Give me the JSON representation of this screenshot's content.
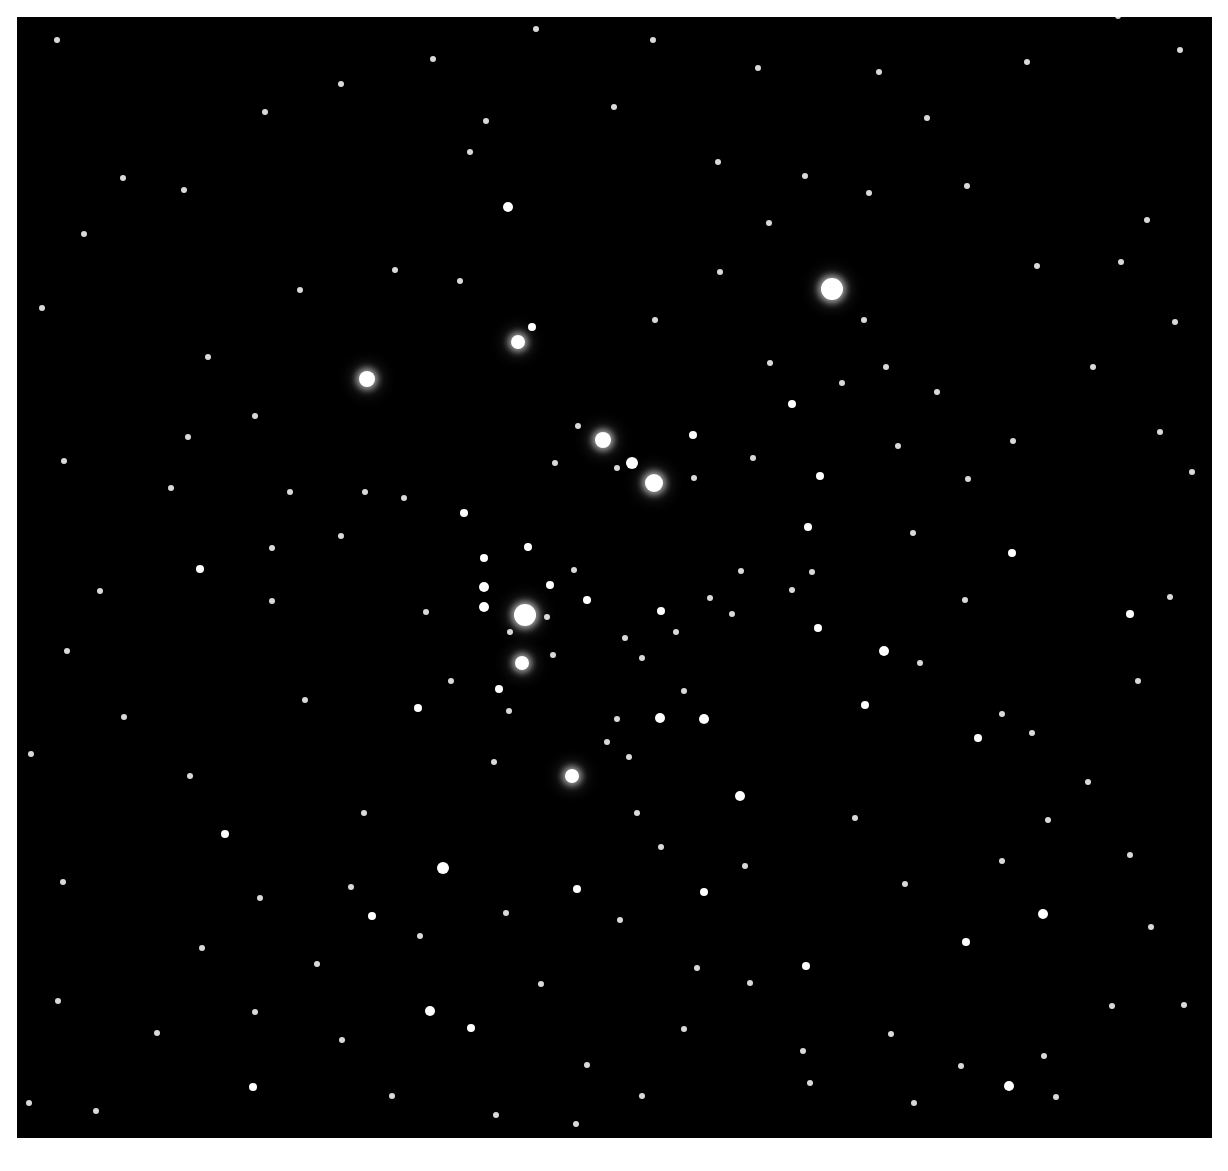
{
  "image": {
    "subject": "open star cluster photograph",
    "frame": {
      "left": 17,
      "top": 17,
      "width": 1195,
      "height": 1121,
      "background": "#000000",
      "border_color": "#ffffff"
    }
  },
  "stars": [
    [
      832,
      289,
      11,
      1
    ],
    [
      525,
      615,
      11,
      1
    ],
    [
      654,
      483,
      9,
      1
    ],
    [
      603,
      440,
      8,
      1
    ],
    [
      367,
      379,
      8,
      1
    ],
    [
      518,
      342,
      7,
      1
    ],
    [
      522,
      663,
      7,
      1
    ],
    [
      572,
      776,
      7,
      1
    ],
    [
      632,
      463,
      6,
      0
    ],
    [
      508,
      207,
      5,
      0
    ],
    [
      484,
      607,
      5,
      0
    ],
    [
      484,
      587,
      5,
      0
    ],
    [
      443,
      868,
      6,
      0
    ],
    [
      740,
      796,
      5,
      0
    ],
    [
      660,
      718,
      5,
      0
    ],
    [
      704,
      719,
      5,
      0
    ],
    [
      884,
      651,
      5,
      0
    ],
    [
      1043,
      914,
      5,
      0
    ],
    [
      1009,
      1086,
      5,
      0
    ],
    [
      430,
      1011,
      5,
      0
    ],
    [
      532,
      327,
      4,
      0
    ],
    [
      528,
      547,
      4,
      0
    ],
    [
      550,
      585,
      4,
      0
    ],
    [
      587,
      600,
      4,
      0
    ],
    [
      499,
      689,
      4,
      0
    ],
    [
      484,
      558,
      4,
      0
    ],
    [
      464,
      513,
      4,
      0
    ],
    [
      693,
      435,
      4,
      0
    ],
    [
      808,
      527,
      4,
      0
    ],
    [
      818,
      628,
      4,
      0
    ],
    [
      820,
      476,
      4,
      0
    ],
    [
      792,
      404,
      4,
      0
    ],
    [
      661,
      611,
      4,
      0
    ],
    [
      372,
      916,
      4,
      0
    ],
    [
      471,
      1028,
      4,
      0
    ],
    [
      577,
      889,
      4,
      0
    ],
    [
      1130,
      614,
      4,
      0
    ],
    [
      1012,
      553,
      4,
      0
    ],
    [
      200,
      569,
      4,
      0
    ],
    [
      225,
      834,
      4,
      0
    ],
    [
      418,
      708,
      4,
      0
    ],
    [
      978,
      738,
      4,
      0
    ],
    [
      865,
      705,
      4,
      0
    ],
    [
      966,
      942,
      4,
      0
    ],
    [
      806,
      966,
      4,
      0
    ],
    [
      704,
      892,
      4,
      0
    ],
    [
      253,
      1087,
      4,
      0
    ],
    [
      1147,
      220,
      3,
      0
    ],
    [
      1192,
      472,
      3,
      0
    ],
    [
      1027,
      62,
      3,
      0
    ],
    [
      1180,
      50,
      3,
      0
    ],
    [
      1118,
      16,
      3,
      0
    ],
    [
      57,
      40,
      3,
      0
    ],
    [
      123,
      178,
      3,
      0
    ],
    [
      208,
      357,
      3,
      0
    ],
    [
      272,
      548,
      3,
      0
    ],
    [
      272,
      601,
      3,
      0
    ],
    [
      305,
      700,
      3,
      0
    ],
    [
      1032,
      733,
      3,
      0
    ],
    [
      637,
      813,
      3,
      0
    ],
    [
      753,
      458,
      3,
      0
    ],
    [
      769,
      223,
      3,
      0
    ],
    [
      869,
      193,
      3,
      0
    ],
    [
      805,
      176,
      3,
      0
    ],
    [
      1112,
      1006,
      3,
      0
    ],
    [
      1044,
      1056,
      3,
      0
    ],
    [
      914,
      1103,
      3,
      0
    ],
    [
      642,
      1096,
      3,
      0
    ],
    [
      750,
      983,
      3,
      0
    ],
    [
      803,
      1051,
      3,
      0
    ],
    [
      697,
      968,
      3,
      0
    ],
    [
      188,
      437,
      3,
      0
    ],
    [
      460,
      281,
      3,
      0
    ],
    [
      486,
      121,
      3,
      0
    ],
    [
      578,
      426,
      3,
      0
    ],
    [
      555,
      463,
      3,
      0
    ],
    [
      617,
      468,
      3,
      0
    ],
    [
      694,
      478,
      3,
      0
    ],
    [
      741,
      571,
      3,
      0
    ],
    [
      792,
      590,
      3,
      0
    ],
    [
      812,
      572,
      3,
      0
    ],
    [
      913,
      533,
      3,
      0
    ],
    [
      920,
      663,
      3,
      0
    ],
    [
      1002,
      714,
      3,
      0
    ],
    [
      1013,
      441,
      3,
      0
    ],
    [
      1093,
      367,
      3,
      0
    ],
    [
      937,
      392,
      3,
      0
    ],
    [
      886,
      367,
      3,
      0
    ],
    [
      842,
      383,
      3,
      0
    ],
    [
      625,
      638,
      3,
      0
    ],
    [
      642,
      658,
      3,
      0
    ],
    [
      617,
      719,
      3,
      0
    ],
    [
      607,
      742,
      3,
      0
    ],
    [
      629,
      757,
      3,
      0
    ],
    [
      684,
      691,
      3,
      0
    ],
    [
      732,
      614,
      3,
      0
    ],
    [
      710,
      598,
      3,
      0
    ],
    [
      676,
      632,
      3,
      0
    ],
    [
      553,
      655,
      3,
      0
    ],
    [
      510,
      632,
      3,
      0
    ],
    [
      547,
      617,
      3,
      0
    ],
    [
      574,
      570,
      3,
      0
    ],
    [
      509,
      711,
      3,
      0
    ],
    [
      494,
      762,
      3,
      0
    ],
    [
      451,
      681,
      3,
      0
    ],
    [
      426,
      612,
      3,
      0
    ],
    [
      404,
      498,
      3,
      0
    ],
    [
      365,
      492,
      3,
      0
    ],
    [
      341,
      536,
      3,
      0
    ],
    [
      290,
      492,
      3,
      0
    ],
    [
      255,
      416,
      3,
      0
    ],
    [
      171,
      488,
      3,
      0
    ],
    [
      100,
      591,
      3,
      0
    ],
    [
      67,
      651,
      3,
      0
    ],
    [
      124,
      717,
      3,
      0
    ],
    [
      190,
      776,
      3,
      0
    ],
    [
      260,
      898,
      3,
      0
    ],
    [
      202,
      948,
      3,
      0
    ],
    [
      157,
      1033,
      3,
      0
    ],
    [
      96,
      1111,
      3,
      0
    ],
    [
      342,
      1040,
      3,
      0
    ],
    [
      364,
      813,
      3,
      0
    ],
    [
      351,
      887,
      3,
      0
    ],
    [
      541,
      984,
      3,
      0
    ],
    [
      587,
      1065,
      3,
      0
    ],
    [
      684,
      1029,
      3,
      0
    ],
    [
      810,
      1083,
      3,
      0
    ],
    [
      891,
      1034,
      3,
      0
    ],
    [
      961,
      1066,
      3,
      0
    ],
    [
      1056,
      1097,
      3,
      0
    ],
    [
      1184,
      1005,
      3,
      0
    ],
    [
      1130,
      855,
      3,
      0
    ],
    [
      1088,
      782,
      3,
      0
    ],
    [
      1138,
      681,
      3,
      0
    ],
    [
      1170,
      597,
      3,
      0
    ],
    [
      1160,
      432,
      3,
      0
    ],
    [
      1175,
      322,
      3,
      0
    ],
    [
      1121,
      262,
      3,
      0
    ],
    [
      1037,
      266,
      3,
      0
    ],
    [
      967,
      186,
      3,
      0
    ],
    [
      927,
      118,
      3,
      0
    ],
    [
      879,
      72,
      3,
      0
    ],
    [
      758,
      68,
      3,
      0
    ],
    [
      653,
      40,
      3,
      0
    ],
    [
      536,
      29,
      3,
      0
    ],
    [
      433,
      59,
      3,
      0
    ],
    [
      341,
      84,
      3,
      0
    ],
    [
      265,
      112,
      3,
      0
    ],
    [
      184,
      190,
      3,
      0
    ],
    [
      84,
      234,
      3,
      0
    ],
    [
      42,
      308,
      3,
      0
    ],
    [
      64,
      461,
      3,
      0
    ],
    [
      31,
      754,
      3,
      0
    ],
    [
      63,
      882,
      3,
      0
    ],
    [
      58,
      1001,
      3,
      0
    ],
    [
      29,
      1103,
      3,
      0
    ],
    [
      300,
      290,
      3,
      0
    ],
    [
      395,
      270,
      3,
      0
    ],
    [
      470,
      152,
      3,
      0
    ],
    [
      614,
      107,
      3,
      0
    ],
    [
      718,
      162,
      3,
      0
    ],
    [
      655,
      320,
      3,
      0
    ],
    [
      720,
      272,
      3,
      0
    ],
    [
      770,
      363,
      3,
      0
    ],
    [
      864,
      320,
      3,
      0
    ],
    [
      898,
      446,
      3,
      0
    ],
    [
      968,
      479,
      3,
      0
    ],
    [
      965,
      600,
      3,
      0
    ],
    [
      855,
      818,
      3,
      0
    ],
    [
      905,
      884,
      3,
      0
    ],
    [
      1002,
      861,
      3,
      0
    ],
    [
      1048,
      820,
      3,
      0
    ],
    [
      1151,
      927,
      3,
      0
    ],
    [
      745,
      866,
      3,
      0
    ],
    [
      661,
      847,
      3,
      0
    ],
    [
      620,
      920,
      3,
      0
    ],
    [
      506,
      913,
      3,
      0
    ],
    [
      420,
      936,
      3,
      0
    ],
    [
      317,
      964,
      3,
      0
    ],
    [
      255,
      1012,
      3,
      0
    ],
    [
      392,
      1096,
      3,
      0
    ],
    [
      496,
      1115,
      3,
      0
    ],
    [
      576,
      1124,
      3,
      0
    ]
  ]
}
